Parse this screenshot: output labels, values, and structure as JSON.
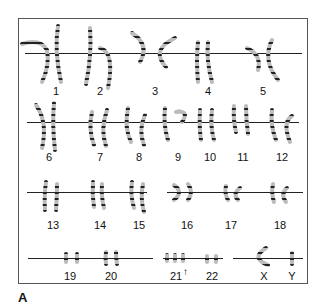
{
  "figure": {
    "panel_label": "A",
    "type": "karyotype",
    "rows": [
      {
        "chromosomes": [
          {
            "label": "1",
            "x": 56
          },
          {
            "label": "2",
            "x": 100
          },
          {
            "label": "3",
            "x": 155
          },
          {
            "label": "4",
            "x": 208
          },
          {
            "label": "5",
            "x": 263
          }
        ]
      },
      {
        "chromosomes": [
          {
            "label": "6",
            "x": 49
          },
          {
            "label": "7",
            "x": 100
          },
          {
            "label": "8",
            "x": 139
          },
          {
            "label": "9",
            "x": 178
          },
          {
            "label": "10",
            "x": 210
          },
          {
            "label": "11",
            "x": 243
          },
          {
            "label": "12",
            "x": 282
          }
        ]
      },
      {
        "chromosomes": [
          {
            "label": "13",
            "x": 53
          },
          {
            "label": "14",
            "x": 100
          },
          {
            "label": "15",
            "x": 139
          },
          {
            "label": "16",
            "x": 187
          },
          {
            "label": "17",
            "x": 231
          },
          {
            "label": "18",
            "x": 280
          }
        ]
      },
      {
        "chromosomes": [
          {
            "label": "19",
            "x": 70
          },
          {
            "label": "20",
            "x": 111
          },
          {
            "label": "21",
            "x": 179
          },
          {
            "label": "22",
            "x": 212
          },
          {
            "label": "X",
            "x": 264
          },
          {
            "label": "Y",
            "x": 292
          }
        ]
      }
    ],
    "annotation": {
      "symbol": "↑",
      "target": "21",
      "meaning": "extra chromosome 21 (trisomy)"
    }
  }
}
